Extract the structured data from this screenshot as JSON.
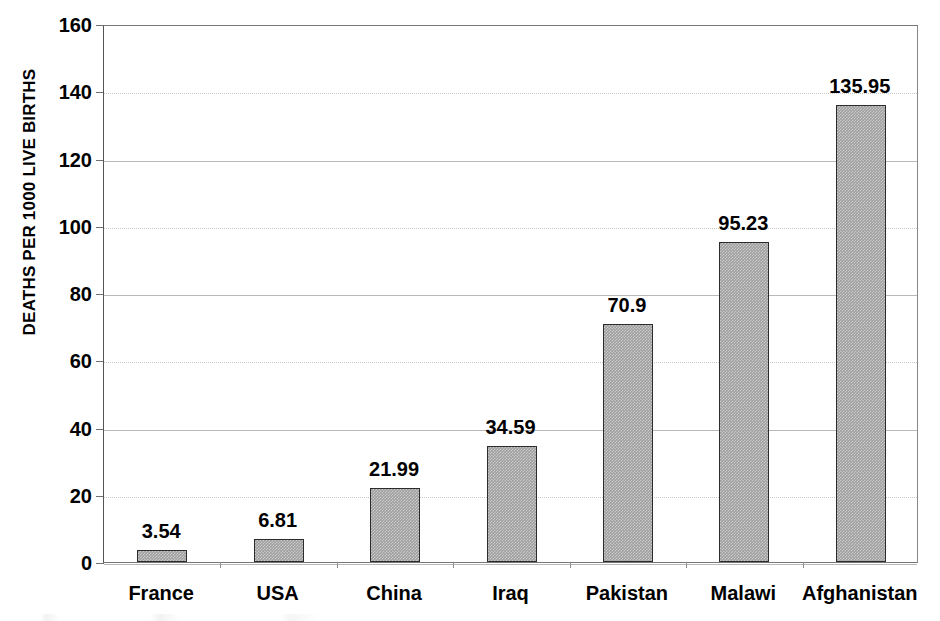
{
  "chart_data": {
    "type": "bar",
    "title": "",
    "subtitle": "",
    "xlabel": "",
    "ylabel": "DEATHS PER 1000 LIVE BIRTHS",
    "categories": [
      "France",
      "USA",
      "China",
      "Iraq",
      "Pakistan",
      "Malawi",
      "Afghanistan"
    ],
    "values": [
      3.54,
      6.81,
      21.99,
      34.59,
      70.9,
      95.23,
      135.95
    ],
    "value_labels": [
      "3.54",
      "6.81",
      "21.99",
      "34.59",
      "70.9",
      "95.23",
      "135.95"
    ],
    "ylim": [
      0,
      160
    ],
    "ytick_step": 20,
    "ytick_labels": [
      "160",
      "140",
      "120",
      "100",
      "80",
      "60",
      "40",
      "20",
      "0"
    ],
    "ytick_values": [
      160,
      140,
      120,
      100,
      80,
      60,
      40,
      20,
      0
    ],
    "grid": true,
    "grid_axis": "y",
    "legend": false,
    "legend_position": "none",
    "bar_color": "#9e9e9e",
    "bar_border_color": "#2b2b2b",
    "gridline_color": "#b9b9b9",
    "axis_color": "#777777",
    "text_color": "#000000",
    "data_labels_shown": true
  }
}
